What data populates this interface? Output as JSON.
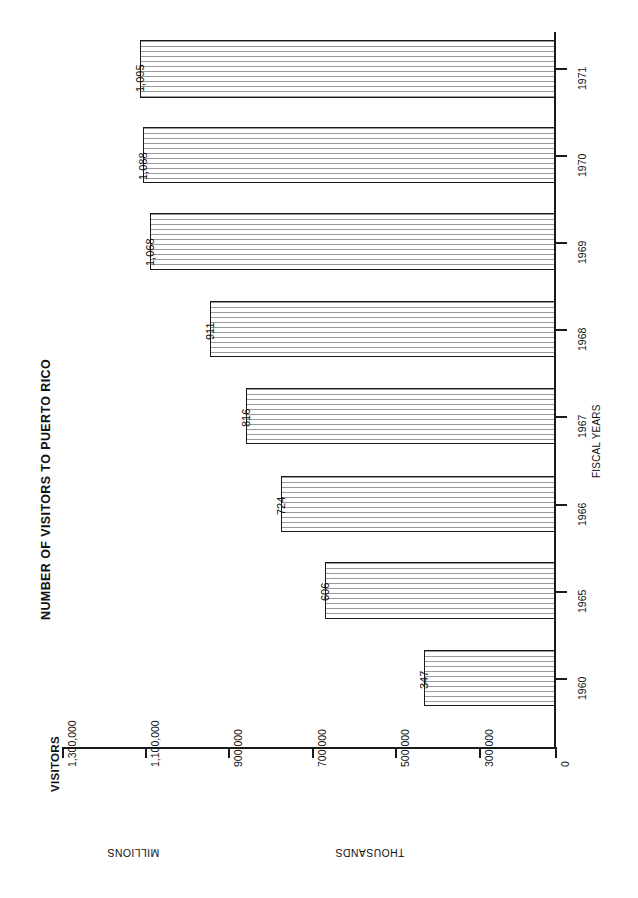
{
  "chart_data": {
    "type": "bar",
    "orientation": "horizontal",
    "title": "NUMBER OF VISITORS TO PUERTO RICO",
    "xlabel": "VISITORS",
    "ylabel": "FISCAL YEARS",
    "categories": [
      "1971",
      "1970",
      "1969",
      "1968",
      "1967",
      "1966",
      "1965",
      "1960"
    ],
    "values": [
      1095000,
      1088000,
      1068000,
      911000,
      816000,
      724000,
      606000,
      347000
    ],
    "data_labels": [
      "1,095",
      "1,088",
      "1,068",
      "911",
      "816",
      "724",
      "606",
      "347"
    ],
    "value_unit": "thousands of visitors",
    "xlim": [
      0,
      1300000
    ],
    "xticks": [
      0,
      300000,
      500000,
      700000,
      900000,
      1100000,
      1300000
    ],
    "xticklabels": [
      "0",
      "300,000",
      "500,000",
      "700,000",
      "900,000",
      "1,100,000",
      "1,300,000"
    ],
    "grid": false,
    "legend": false,
    "scale_bands": [
      {
        "label": "MILLIONS",
        "range": [
          1000000,
          1300000
        ]
      },
      {
        "label": "THOUSANDS",
        "range": [
          0,
          1000000
        ]
      }
    ]
  },
  "axis": {
    "value_caption": "VISITORS",
    "category_caption": "FISCAL YEARS",
    "band_millions": "MILLIONS",
    "band_thousands": "THOUSANDS"
  },
  "ticks": {
    "value": [
      {
        "label": "1,300,000",
        "value": 1300000,
        "x": 62
      },
      {
        "label": "1,100,000",
        "value": 1100000,
        "x": 145
      },
      {
        "label": "900,000",
        "value": 900000,
        "x": 228
      },
      {
        "label": "700,000",
        "value": 700000,
        "x": 312
      },
      {
        "label": "500,000",
        "value": 500000,
        "x": 395
      },
      {
        "label": "300,000",
        "value": 300000,
        "x": 479
      },
      {
        "label": "0",
        "value": 0,
        "x": 555
      }
    ]
  },
  "bars": [
    {
      "year": "1971",
      "label": "1,095",
      "value": 1095000,
      "top": 40,
      "height": 58,
      "left": 140,
      "width": 415,
      "tick_top": 68,
      "label_y": 92
    },
    {
      "year": "1970",
      "label": "1,088",
      "value": 1088000,
      "top": 127,
      "height": 56,
      "left": 143,
      "width": 412,
      "tick_top": 155,
      "label_y": 180
    },
    {
      "year": "1969",
      "label": "1,068",
      "value": 1068000,
      "top": 213,
      "height": 57,
      "left": 150,
      "width": 405,
      "tick_top": 242,
      "label_y": 266
    },
    {
      "year": "1968",
      "label": "911",
      "value": 911000,
      "top": 301,
      "height": 56,
      "left": 210,
      "width": 345,
      "tick_top": 329,
      "label_y": 340
    },
    {
      "year": "1967",
      "label": "816",
      "value": 816000,
      "top": 388,
      "height": 56,
      "left": 246,
      "width": 309,
      "tick_top": 416,
      "label_y": 427
    },
    {
      "year": "1966",
      "label": "724",
      "value": 724000,
      "top": 476,
      "height": 56,
      "left": 281,
      "width": 274,
      "tick_top": 504,
      "label_y": 515
    },
    {
      "year": "1965",
      "label": "606",
      "value": 606000,
      "top": 562,
      "height": 57,
      "left": 325,
      "width": 230,
      "tick_top": 591,
      "label_y": 601
    },
    {
      "year": "1960",
      "label": "347",
      "value": 347000,
      "top": 650,
      "height": 56,
      "left": 424,
      "width": 131,
      "tick_top": 678,
      "label_y": 689
    }
  ]
}
